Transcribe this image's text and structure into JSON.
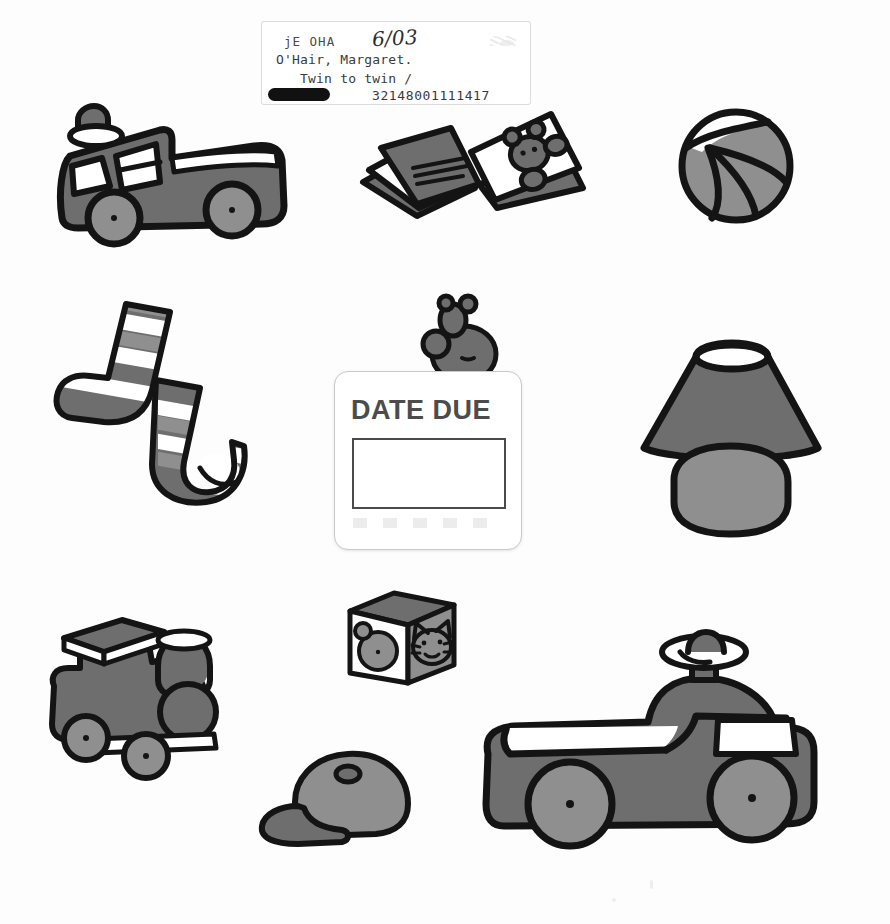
{
  "page": {
    "type": "scanned-picture-book-cover",
    "background_color": "#fdfdfd"
  },
  "library_label": {
    "call_number": "jE OHA",
    "date_stamp": "6/03",
    "author": "O'Hair, Margaret.",
    "title": "Twin to twin /",
    "barcode": "32148001111417",
    "redaction": "redacted-block"
  },
  "date_due_card": {
    "heading": "DATE DUE",
    "entries": []
  },
  "illustrations": [
    {
      "name": "fire-truck",
      "label": "Fire truck toy"
    },
    {
      "name": "open-book",
      "label": "Open picture book with teddy bear"
    },
    {
      "name": "beach-ball",
      "label": "Beach ball"
    },
    {
      "name": "striped-socks",
      "label": "Pair of striped socks"
    },
    {
      "name": "teddy-bear",
      "label": "Teddy bear"
    },
    {
      "name": "table-lamp",
      "label": "Table lamp"
    },
    {
      "name": "toy-train",
      "label": "Toy train engine"
    },
    {
      "name": "alphabet-block",
      "label": "Toy block with cat face"
    },
    {
      "name": "baseball-cap",
      "label": "Baseball cap"
    },
    {
      "name": "ride-on-car",
      "label": "Ride-on toy car"
    }
  ],
  "colors": {
    "ink": "#141414",
    "dark_gray": "#6e6e6e",
    "light_gray": "#8f8f8f",
    "white": "#ffffff",
    "label_text": "#3a3a3a",
    "date_due_text": "#4c4c4c"
  }
}
